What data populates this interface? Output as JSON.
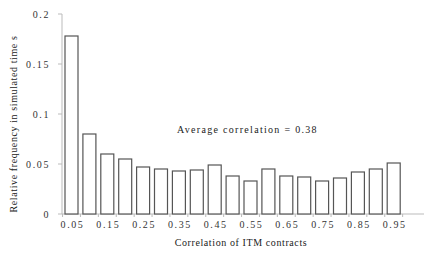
{
  "chart_data": {
    "type": "bar",
    "title": "",
    "xlabel": "Correlation of ITM contracts",
    "ylabel": "Relative frequency in simulated time s",
    "annotation": "Average correlation = 0.38",
    "ylim": [
      0,
      0.2
    ],
    "yticks": [
      "0",
      "0.05",
      "0.1",
      "0.15",
      "0.2"
    ],
    "ytick_values": [
      0,
      0.05,
      0.1,
      0.15,
      0.2
    ],
    "categories": [
      "0.05",
      "0.1",
      "0.15",
      "0.2",
      "0.25",
      "0.3",
      "0.35",
      "0.4",
      "0.45",
      "0.5",
      "0.55",
      "0.6",
      "0.65",
      "0.7",
      "0.75",
      "0.8",
      "0.85",
      "0.9",
      "0.95"
    ],
    "xtick_labels_shown": [
      "0.05",
      "0.15",
      "0.25",
      "0.35",
      "0.45",
      "0.55",
      "0.65",
      "0.75",
      "0.85",
      "0.95"
    ],
    "values": [
      0.178,
      0.08,
      0.06,
      0.055,
      0.047,
      0.045,
      0.043,
      0.044,
      0.049,
      0.038,
      0.033,
      0.045,
      0.038,
      0.037,
      0.033,
      0.036,
      0.042,
      0.045,
      0.051
    ],
    "grid": false,
    "legend": null
  },
  "style": {
    "bar_fill": "#ffffff",
    "bar_stroke": "#555555",
    "axis_color": "#bbbbbb"
  }
}
